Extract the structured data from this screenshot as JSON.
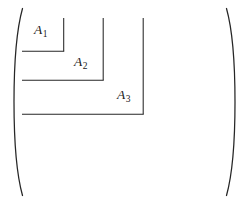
{
  "figure": {
    "type": "block-matrix-diagram",
    "background_color": "#ffffff",
    "line_color": "#262626",
    "text_color": "#1a1a1a"
  },
  "delimiters": {
    "left": {
      "name": "left-parenthesis",
      "glyph": "(",
      "x": 18,
      "top": 8,
      "bottom": 196
    },
    "right": {
      "name": "right-parenthesis",
      "glyph": ")",
      "x": 231,
      "top": 8,
      "bottom": 196
    }
  },
  "blocks": [
    {
      "id": "A1",
      "base": "A",
      "subscript": "1",
      "label_x": 34,
      "label_y": 23,
      "rule_left": 22,
      "rule_right": 64,
      "rule_top": 18,
      "rule_bottom": 51
    },
    {
      "id": "A2",
      "base": "A",
      "subscript": "2",
      "label_x": 74,
      "label_y": 55,
      "rule_left": 22,
      "rule_right": 103,
      "rule_top": 18,
      "rule_bottom": 80
    },
    {
      "id": "A3",
      "base": "A",
      "subscript": "3",
      "label_x": 117,
      "label_y": 88,
      "rule_left": 22,
      "rule_right": 143,
      "rule_top": 18,
      "rule_bottom": 114
    }
  ]
}
